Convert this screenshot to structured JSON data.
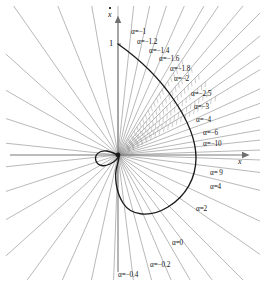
{
  "figure": {
    "background": "#ffffff",
    "origin": {
      "x": 118,
      "y": 155
    },
    "axes": {
      "x_axis_label": "x",
      "y_axis_label": "x",
      "y_axis_label_has_dot": true,
      "y_tick_label": "1",
      "y_tick_value": 1,
      "x_axis_y": 155,
      "y_axis_x": 118,
      "x_axis_from": 10,
      "x_axis_to": 248,
      "y_axis_from": 17,
      "y_axis_to": 272
    },
    "colors": {
      "curve": "#1a1a1a",
      "rays": "#8c8c8c",
      "rays_hatched": "#9a9a9a",
      "axis": "#7a7a7a",
      "text": "#111111"
    }
  },
  "chart_data": {
    "type": "line",
    "title": "",
    "xlabel": "x",
    "ylabel": "x-dot",
    "grid": false,
    "legend": "none",
    "xlim": [
      -2.1,
      2.4
    ],
    "ylim": [
      -1.6,
      1.5
    ],
    "alpha_labels": [
      {
        "text": "α=−1",
        "value": -1,
        "x": 131,
        "y": 29,
        "ray_angle_deg": 56,
        "hatched": true
      },
      {
        "text": "α=−1.2",
        "value": -1.2,
        "x": 137,
        "y": 39,
        "ray_angle_deg": 50,
        "hatched": true
      },
      {
        "text": "α=−1.4",
        "value": -1.4,
        "x": 149,
        "y": 48,
        "ray_angle_deg": 45,
        "hatched": true
      },
      {
        "text": "α=−1.6",
        "value": -1.6,
        "x": 159,
        "y": 56,
        "ray_angle_deg": 40,
        "hatched": true
      },
      {
        "text": "α=−1.8",
        "value": -1.8,
        "x": 170,
        "y": 66,
        "ray_angle_deg": 35,
        "hatched": true
      },
      {
        "text": "α=−2",
        "value": -2,
        "x": 174,
        "y": 76,
        "ray_angle_deg": 31,
        "hatched": true
      },
      {
        "text": "α=−2.5",
        "value": -2.5,
        "x": 191,
        "y": 91,
        "ray_angle_deg": 25,
        "hatched": false
      },
      {
        "text": "α=−3",
        "value": -3,
        "x": 194,
        "y": 104,
        "ray_angle_deg": 20,
        "hatched": false
      },
      {
        "text": "α=−4",
        "value": -4,
        "x": 196,
        "y": 117,
        "ray_angle_deg": 15,
        "hatched": false
      },
      {
        "text": "α=−6",
        "value": -6,
        "x": 203,
        "y": 130,
        "ray_angle_deg": 10,
        "hatched": false
      },
      {
        "text": "α=−10",
        "value": -10,
        "x": 203,
        "y": 141,
        "ray_angle_deg": 6,
        "hatched": false
      },
      {
        "text": "α= 9",
        "value": 9,
        "x": 210,
        "y": 170,
        "ray_angle_deg": -7,
        "hatched": false
      },
      {
        "text": "α=4",
        "value": 4,
        "x": 210,
        "y": 184,
        "ray_angle_deg": -14,
        "hatched": false
      },
      {
        "text": "α=2",
        "value": 2,
        "x": 196,
        "y": 206,
        "ray_angle_deg": -25,
        "hatched": false
      },
      {
        "text": "α=0",
        "value": 0,
        "x": 172,
        "y": 240,
        "ray_angle_deg": -45,
        "hatched": false
      },
      {
        "text": "α=−0.2",
        "value": -0.2,
        "x": 150,
        "y": 262,
        "ray_angle_deg": -60,
        "hatched": false
      },
      {
        "text": "α=−0.4",
        "value": -0.4,
        "x": 118,
        "y": 272,
        "ray_angle_deg": -75,
        "hatched": false
      }
    ],
    "rays": {
      "count": 36,
      "note": "Straight isocline rays emanate from the origin at regular angular spacing in every direction.",
      "angles_deg": [
        90,
        84,
        78,
        72,
        66,
        60,
        56,
        50,
        45,
        40,
        35,
        31,
        25,
        20,
        15,
        10,
        6,
        2,
        -2,
        -7,
        -14,
        -25,
        -35,
        -45,
        -53,
        -60,
        -67,
        -75,
        -83,
        100,
        112,
        125,
        138,
        150,
        162,
        174,
        186,
        198,
        210,
        222,
        234,
        246,
        258,
        268
      ]
    },
    "trajectory": {
      "name": "limit-cycle-loop",
      "start": {
        "x": 0,
        "y": 1
      },
      "max_x": 1.6,
      "min_y": -1.15,
      "closed": true
    }
  }
}
